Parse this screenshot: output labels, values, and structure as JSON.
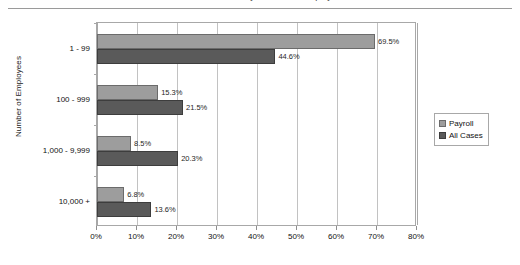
{
  "title": {
    "text": "Percent of Cases by Number of Employees",
    "clipped": true
  },
  "legend": {
    "position": "right",
    "entries": [
      {
        "label": "Payroll",
        "color": "#9d9d9d"
      },
      {
        "label": "All Cases",
        "color": "#5a5a5a"
      }
    ]
  },
  "axis": {
    "y_title": "Number of Employees",
    "x_ticks": [
      "0%",
      "10%",
      "20%",
      "30%",
      "40%",
      "50%",
      "60%",
      "70%",
      "80%"
    ]
  },
  "chart_data": {
    "type": "bar",
    "orientation": "horizontal",
    "title": "Percent of Cases by Number of Employees",
    "xlabel": "",
    "ylabel": "Number of Employees",
    "xlim": [
      0,
      80
    ],
    "xtick_step": 10,
    "xtick_suffix": "%",
    "grid": true,
    "legend_position": "right",
    "categories": [
      "1 - 99",
      "100 - 999",
      "1,000 - 9,999",
      "10,000 +"
    ],
    "series": [
      {
        "name": "Payroll",
        "color": "#9d9d9d",
        "values": [
          69.5,
          15.3,
          8.5,
          6.8
        ],
        "labels": [
          "69.5%",
          "15.3%",
          "8.5%",
          "6.8%"
        ]
      },
      {
        "name": "All Cases",
        "color": "#5a5a5a",
        "values": [
          44.6,
          21.5,
          20.3,
          13.6
        ],
        "labels": [
          "44.6%",
          "21.5%",
          "20.3%",
          "13.6%"
        ]
      }
    ]
  }
}
